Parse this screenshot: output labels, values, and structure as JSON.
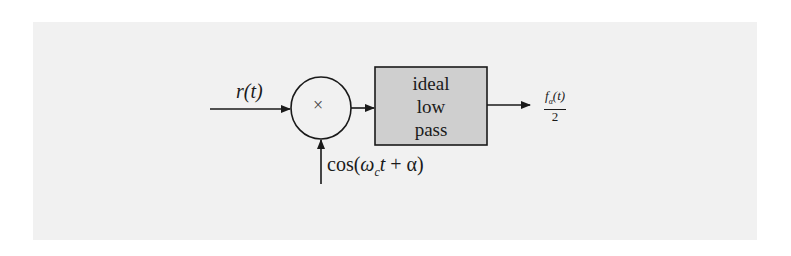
{
  "diagram": {
    "type": "block-diagram",
    "input_signal": "r(t)",
    "multiplier_symbol": "×",
    "filter_block": {
      "lines": [
        "ideal",
        "low",
        "pass"
      ],
      "fill": "#cfcfcf"
    },
    "carrier": {
      "prefix": "cos(",
      "omega": "ω",
      "omega_sub": "c",
      "t": "t",
      "suffix": " + α)"
    },
    "output": {
      "numerator_f": "f",
      "numerator_sub": "α",
      "numerator_arg": "(t)",
      "denominator": "2"
    },
    "colors": {
      "background": "#f1f1f1",
      "ink": "#1a1a1a",
      "box_fill": "#cfcfcf"
    }
  }
}
